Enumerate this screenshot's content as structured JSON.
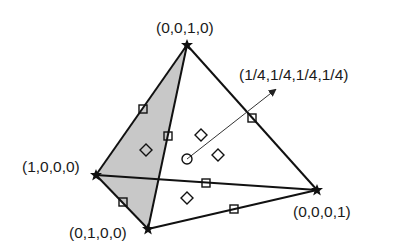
{
  "diagram": {
    "vertices": [
      {
        "id": "top",
        "label": "(0,0,1,0)",
        "x": 187,
        "y": 45
      },
      {
        "id": "left",
        "label": "(1,0,0,0)",
        "x": 96,
        "y": 175
      },
      {
        "id": "bottom",
        "label": "(0,1,0,0)",
        "x": 148,
        "y": 229
      },
      {
        "id": "right",
        "label": "(0,0,0,1)",
        "x": 317,
        "y": 190
      }
    ],
    "center": {
      "label": "(1/4,1/4,1/4,1/4)",
      "x": 187,
      "y": 159
    },
    "arrow": {
      "from": [
        187,
        159
      ],
      "to": [
        275,
        90
      ]
    },
    "shaded_face": [
      "top",
      "left",
      "bottom"
    ],
    "shade_color": "#c8c8c8",
    "edge_color": "#111111",
    "square_markers": [
      {
        "x": 143,
        "y": 109
      },
      {
        "x": 168,
        "y": 136
      },
      {
        "x": 252,
        "y": 118
      },
      {
        "x": 206,
        "y": 183
      },
      {
        "x": 123,
        "y": 202
      },
      {
        "x": 234,
        "y": 209
      }
    ],
    "diamond_markers": [
      {
        "x": 146,
        "y": 150
      },
      {
        "x": 201,
        "y": 135
      },
      {
        "x": 218,
        "y": 155
      },
      {
        "x": 187,
        "y": 198
      }
    ],
    "circle_markers": [
      {
        "x": 187,
        "y": 159
      }
    ]
  }
}
